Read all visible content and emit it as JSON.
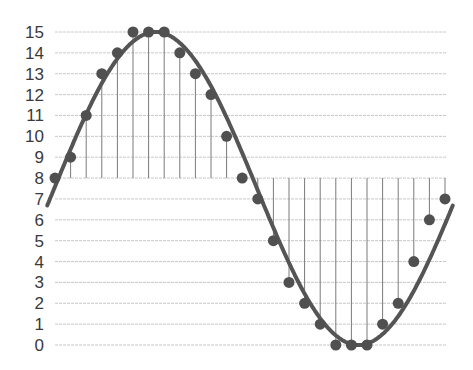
{
  "chart_data": {
    "type": "line",
    "title": "",
    "xlabel": "",
    "ylabel": "",
    "ylim": [
      0,
      15
    ],
    "yticks": [
      0,
      1,
      2,
      3,
      4,
      5,
      6,
      7,
      8,
      9,
      10,
      11,
      12,
      13,
      14,
      15
    ],
    "grid": "horizontal",
    "legend": null,
    "baseline": 8,
    "x": [
      0,
      1,
      2,
      3,
      4,
      5,
      6,
      7,
      8,
      9,
      10,
      11,
      12,
      13,
      14,
      15,
      16,
      17,
      18,
      19,
      20,
      21,
      22,
      23,
      24,
      25
    ],
    "series": [
      {
        "name": "samples",
        "values": [
          8,
          9,
          11,
          13,
          14,
          15,
          15,
          15,
          14,
          13,
          12,
          10,
          8,
          7,
          5,
          3,
          2,
          1,
          0,
          0,
          0,
          1,
          2,
          4,
          6,
          7
        ]
      }
    ]
  },
  "colors": {
    "curve": "#555555",
    "points": "#505050",
    "stems": "#7a7a7a",
    "grid": "#c8c8c8",
    "labels": "#3a3a3a"
  }
}
